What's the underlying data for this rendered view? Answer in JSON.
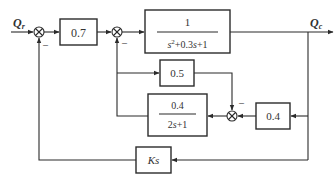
{
  "diagram": {
    "type": "control-system-block-diagram",
    "signals": {
      "input": {
        "symbol": "Q",
        "subscript": "r"
      },
      "output": {
        "symbol": "Q",
        "subscript": "c"
      }
    },
    "blocks": {
      "gain_07": {
        "label": "0.7"
      },
      "plant": {
        "numerator": "1",
        "denominator_a": "s",
        "denominator_sup": "2",
        "denominator_b": "+0.3",
        "denominator_c": "s",
        "denominator_d": "+1"
      },
      "gain_05": {
        "label": "0.5"
      },
      "lag": {
        "numerator": "0.4",
        "denominator_a": "2",
        "denominator_b": "s",
        "denominator_c": "+1"
      },
      "gain_04": {
        "label": "0.4"
      },
      "derivative": {
        "label_k": "K",
        "label_s": "s"
      }
    },
    "summing_junctions": {
      "sum1": {
        "minus_label": "–"
      },
      "sum2": {
        "minus_label": "–"
      },
      "sum3": {
        "minus_label": "–"
      }
    },
    "colors": {
      "line": "#2b2b2b",
      "text": "#333333",
      "background": "#ffffff"
    }
  }
}
